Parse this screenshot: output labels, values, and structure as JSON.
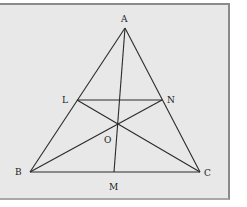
{
  "diagram": {
    "points": {
      "A": {
        "label": "A",
        "x": 125,
        "y": 28,
        "lx": 121,
        "ly": 22
      },
      "B": {
        "label": "B",
        "x": 30,
        "y": 172,
        "lx": 15,
        "ly": 175
      },
      "C": {
        "label": "C",
        "x": 200,
        "y": 172,
        "lx": 204,
        "ly": 176
      },
      "L": {
        "label": "L",
        "x": 77,
        "y": 100,
        "lx": 62,
        "ly": 103
      },
      "N": {
        "label": "N",
        "x": 162,
        "y": 100,
        "lx": 167,
        "ly": 103
      },
      "O": {
        "label": "O",
        "x": 118,
        "y": 124,
        "lx": 104,
        "ly": 143
      },
      "M": {
        "label": "M",
        "x": 114,
        "y": 172,
        "lx": 109,
        "ly": 190
      }
    },
    "segments": [
      [
        "A",
        "B"
      ],
      [
        "A",
        "C"
      ],
      [
        "B",
        "C"
      ],
      [
        "L",
        "N"
      ],
      [
        "A",
        "M"
      ],
      [
        "L",
        "C"
      ],
      [
        "N",
        "B"
      ]
    ],
    "colors": {
      "line": "#2a2a2a",
      "background": "#e8e8e8",
      "frame": "#8a8a8a"
    }
  }
}
